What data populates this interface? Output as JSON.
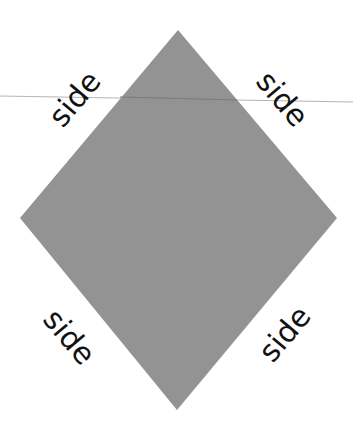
{
  "diagram": {
    "shape": "rhombus",
    "fill_color": "#939393",
    "labels": {
      "top_left": "side",
      "top_right": "side",
      "bottom_left": "side",
      "bottom_right": "side"
    }
  }
}
